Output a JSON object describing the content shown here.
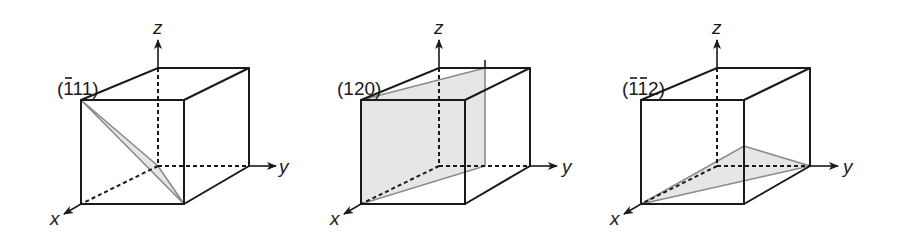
{
  "figure": {
    "panels": [
      {
        "label_parts": [
          "(",
          "1",
          "11)"
        ],
        "label_text": "(-111)",
        "overbars": [
          1
        ],
        "axes": {
          "x": "x",
          "y": "y",
          "z": "z"
        },
        "plane_vertices": [
          "front-top-left",
          "origin",
          "front-bottom-right"
        ]
      },
      {
        "label_parts": [
          "(120)"
        ],
        "label_text": "(120)",
        "overbars": [],
        "axes": {
          "x": "x",
          "y": "y",
          "z": "z"
        },
        "plane_vertices": [
          "front-top-left",
          "back-top-mid-y",
          "back-bottom-mid-y",
          "front-bottom-left"
        ]
      },
      {
        "label_parts": [
          "(",
          "1",
          "1",
          "2)"
        ],
        "label_text": "(-1-12)",
        "overbars": [
          1,
          2
        ],
        "axes": {
          "x": "x",
          "y": "y",
          "z": "z"
        },
        "plane_vertices": [
          "front-bottom-left",
          "back-bottom-right",
          "front-right-edge-mid-z"
        ]
      }
    ],
    "colors": {
      "line": "#1a1a1a",
      "plane_fill": "#e6e6e6",
      "plane_stroke": "#8a8a8a",
      "background": "#ffffff"
    }
  }
}
